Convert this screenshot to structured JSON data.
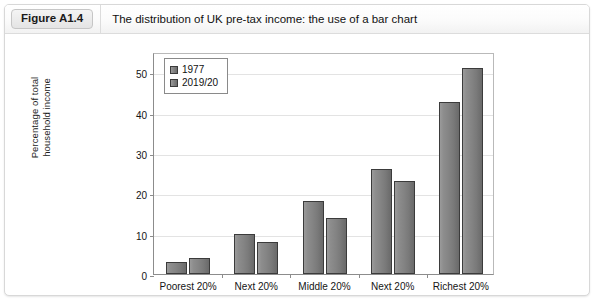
{
  "header": {
    "badge": "Figure A1.4",
    "title": "The distribution of UK pre-tax income: the use of a bar chart"
  },
  "chart_data": {
    "type": "bar",
    "title": "",
    "xlabel": "",
    "ylabel": "Percentage of total household income",
    "ylabel_line1": "Percentage of total",
    "ylabel_line2": "household income",
    "categories": [
      "Poorest 20%",
      "Next 20%",
      "Middle 20%",
      "Next 20%",
      "Richest 20%"
    ],
    "series": [
      {
        "name": "1977",
        "values": [
          3,
          10,
          18,
          26,
          42.5
        ]
      },
      {
        "name": "2019/20",
        "values": [
          4,
          8,
          14,
          23,
          51
        ]
      }
    ],
    "ylim": [
      0,
      55
    ],
    "yticks": [
      0,
      10,
      20,
      30,
      40,
      50
    ],
    "ytick_labels": [
      "0",
      "10",
      "20",
      "30",
      "40",
      "50"
    ],
    "grid": true,
    "legend_position": "top-left",
    "bar_color": "#808080",
    "bar_edge_color": "#3b3b3b",
    "grid_color": "#e3e3e3",
    "axis_color": "#8c8c8c"
  }
}
